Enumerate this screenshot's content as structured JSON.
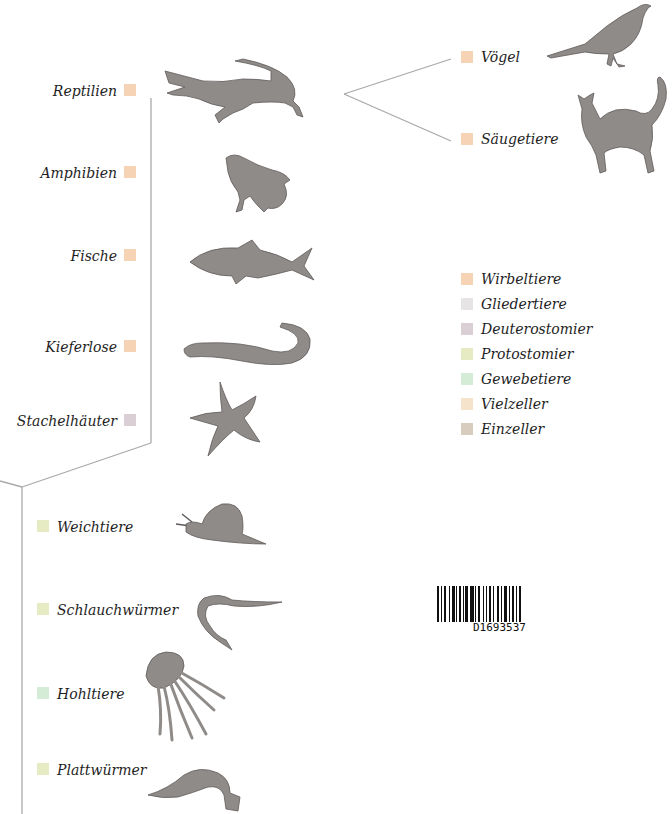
{
  "colors": {
    "wirbeltiere": "#f6d3b5",
    "gliedertiere": "#e6e4e4",
    "deuterostomier": "#dbcfd6",
    "protostomier": "#e6ebc3",
    "gewebetiere": "#d4ecd6",
    "vielzeller": "#f5e4cb",
    "einzeller": "#d7ccbd",
    "line": "#a9a9a9",
    "animal_fill": "#8f8b89",
    "animal_stroke": "#5f5b59"
  },
  "tree": {
    "upper_right": [
      {
        "label": "Vögel",
        "group": "Wirbeltiere",
        "animal": "bird-icon"
      },
      {
        "label": "Säugetiere",
        "group": "Wirbeltiere",
        "animal": "cat-icon"
      }
    ],
    "left_branch": [
      {
        "label": "Reptilien",
        "group": "Wirbeltiere",
        "animal": "crocodile-icon"
      },
      {
        "label": "Amphibien",
        "group": "Wirbeltiere",
        "animal": "frog-icon"
      },
      {
        "label": "Fische",
        "group": "Wirbeltiere",
        "animal": "fish-icon"
      },
      {
        "label": "Kieferlose",
        "group": "Wirbeltiere",
        "animal": "lamprey-icon"
      },
      {
        "label": "Stachelhäuter",
        "group": "Deuterostomier",
        "animal": "starfish-icon"
      }
    ],
    "lower_branch": [
      {
        "label": "Weichtiere",
        "group": "Protostomier",
        "animal": "snail-icon"
      },
      {
        "label": "Schlauchwürmer",
        "group": "Protostomier",
        "animal": "roundworm-icon"
      },
      {
        "label": "Hohltiere",
        "group": "Gewebetiere",
        "animal": "jellyfish-icon"
      },
      {
        "label": "Plattwürmer",
        "group": "Protostomier",
        "animal": "flatworm-icon"
      }
    ]
  },
  "legend": {
    "items": [
      {
        "label": "Wirbeltiere",
        "color": "#f6d3b5"
      },
      {
        "label": "Gliedertiere",
        "color": "#e6e4e4"
      },
      {
        "label": "Deuterostomier",
        "color": "#dbcfd6"
      },
      {
        "label": "Protostomier",
        "color": "#e6ebc3"
      },
      {
        "label": "Gewebetiere",
        "color": "#d4ecd6"
      },
      {
        "label": "Vielzeller",
        "color": "#f5e4cb"
      },
      {
        "label": "Einzeller",
        "color": "#d7ccbd"
      }
    ]
  },
  "barcode": {
    "number": "D1693537"
  }
}
